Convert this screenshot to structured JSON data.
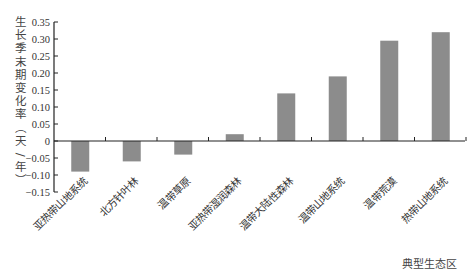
{
  "chart_data": {
    "type": "bar",
    "title": "",
    "xlabel": "典型生态区",
    "ylabel": "生长季末期变化率（天/年）",
    "ylim": [
      -0.15,
      0.35
    ],
    "yticks": [
      "0.35",
      "0.30",
      "0.25",
      "0.20",
      "0.15",
      "0.10",
      "0.05",
      "0",
      "-0.05",
      "-0.10",
      "-0.15"
    ],
    "ytick_values": [
      0.35,
      0.3,
      0.25,
      0.2,
      0.15,
      0.1,
      0.05,
      0,
      -0.05,
      -0.1,
      -0.15
    ],
    "grid": false,
    "legend": null,
    "categories": [
      "亚热带山地系统",
      "北方针叶林",
      "温带草原",
      "亚热带湿润森林",
      "温带大陆性森林",
      "温带山地系统",
      "温带荒漠",
      "热带山地系统"
    ],
    "values": [
      -0.09,
      -0.06,
      -0.04,
      0.02,
      0.14,
      0.19,
      0.295,
      0.32
    ],
    "bar_color": "#8c8c8c"
  },
  "ylabel_chars": [
    "生",
    "长",
    "季",
    "末",
    "期",
    "变",
    "化",
    "率",
    "（",
    "天",
    "/",
    "年",
    "）"
  ]
}
